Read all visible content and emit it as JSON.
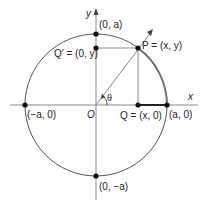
{
  "figure": {
    "type": "unit-circle-trig-definition",
    "colors": {
      "axes": "#888888",
      "circle": "#555555",
      "highlight_arc": "#6b6b6b",
      "points": "#111111",
      "text": "#222222"
    },
    "axes": {
      "x_label": "x",
      "y_label": "y",
      "origin_label": "O"
    },
    "angle_label": "θ",
    "points": {
      "P": "P = (x, y)",
      "Q": "Q = (x, 0)",
      "Q_prime": "Q′ = (0, y)",
      "top": "(0, a)",
      "bottom": "(0, −a)",
      "right": "(a, 0)",
      "left": "(−a, 0)"
    }
  }
}
